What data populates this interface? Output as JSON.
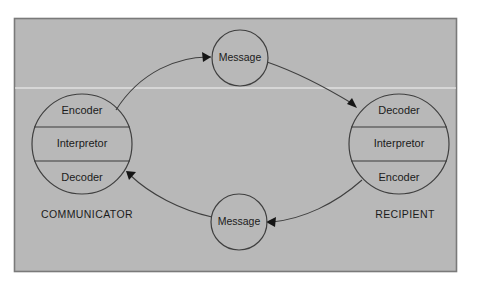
{
  "figure": {
    "background_color": "#ffffff",
    "panel_color": "#b8b8b8",
    "panel_border_color": "#7a7a7a",
    "line_color": "#3f3f3f",
    "text_color": "#1b1b1b"
  },
  "communicator": {
    "caption": "COMMUNICATOR",
    "segments": [
      {
        "label": "Encoder"
      },
      {
        "label": "Interpretor"
      },
      {
        "label": "Decoder"
      }
    ]
  },
  "recipient": {
    "caption": "RECIPIENT",
    "segments": [
      {
        "label": "Decoder"
      },
      {
        "label": "Interpretor"
      },
      {
        "label": "Encoder"
      }
    ]
  },
  "messages": {
    "top": {
      "label": "Message"
    },
    "bottom": {
      "label": "Message"
    }
  },
  "flows": [
    {
      "name": "communicator-to-message-top",
      "from": "Communicator",
      "to": "Message (top)"
    },
    {
      "name": "message-top-to-recipient",
      "from": "Message (top)",
      "to": "Recipient"
    },
    {
      "name": "recipient-to-message-bottom",
      "from": "Recipient",
      "to": "Message (bottom)"
    },
    {
      "name": "message-bottom-to-communicator",
      "from": "Message (bottom)",
      "to": "Communicator"
    }
  ]
}
